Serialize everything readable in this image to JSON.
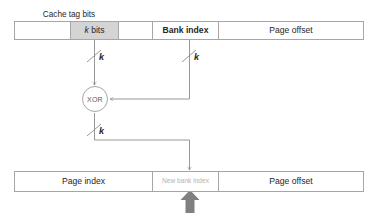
{
  "diagram": {
    "dimension": {
      "cache_tag_bits_label": "Cache tag bits"
    },
    "top_bar": {
      "name": "physical-address-fields",
      "cells": [
        {
          "label": "",
          "kind": "blank",
          "width_px": 56
        },
        {
          "label": "k bits",
          "kind": "shaded",
          "width_px": 48,
          "italic_prefix": "k",
          "rest": " bits"
        },
        {
          "label": "",
          "kind": "blank",
          "width_px": 34
        },
        {
          "label": "Bank index",
          "kind": "bold",
          "width_px": 66
        },
        {
          "label": "Page offset",
          "kind": "plain",
          "width_px": 146
        }
      ]
    },
    "bottom_bar": {
      "name": "translated-address-fields",
      "cells": [
        {
          "label": "Page index",
          "kind": "plain",
          "width_px": 138
        },
        {
          "label": "New bank index",
          "kind": "faint",
          "width_px": 66
        },
        {
          "label": "Page offset",
          "kind": "plain",
          "width_px": 146
        }
      ]
    },
    "xor_node": {
      "label": "XOR"
    },
    "wire_labels": {
      "from_tag_bits": "k",
      "from_bank_index": "k",
      "to_new_bank_index": "k"
    },
    "colors": {
      "border": "#a6a6a6",
      "wire": "#8c8c8c",
      "shaded_cell": "#d4d4d4",
      "faint_text": "#b3b3b3",
      "text": "#262626",
      "emphasis_arrow": "#808080",
      "background": "#ffffff"
    }
  }
}
